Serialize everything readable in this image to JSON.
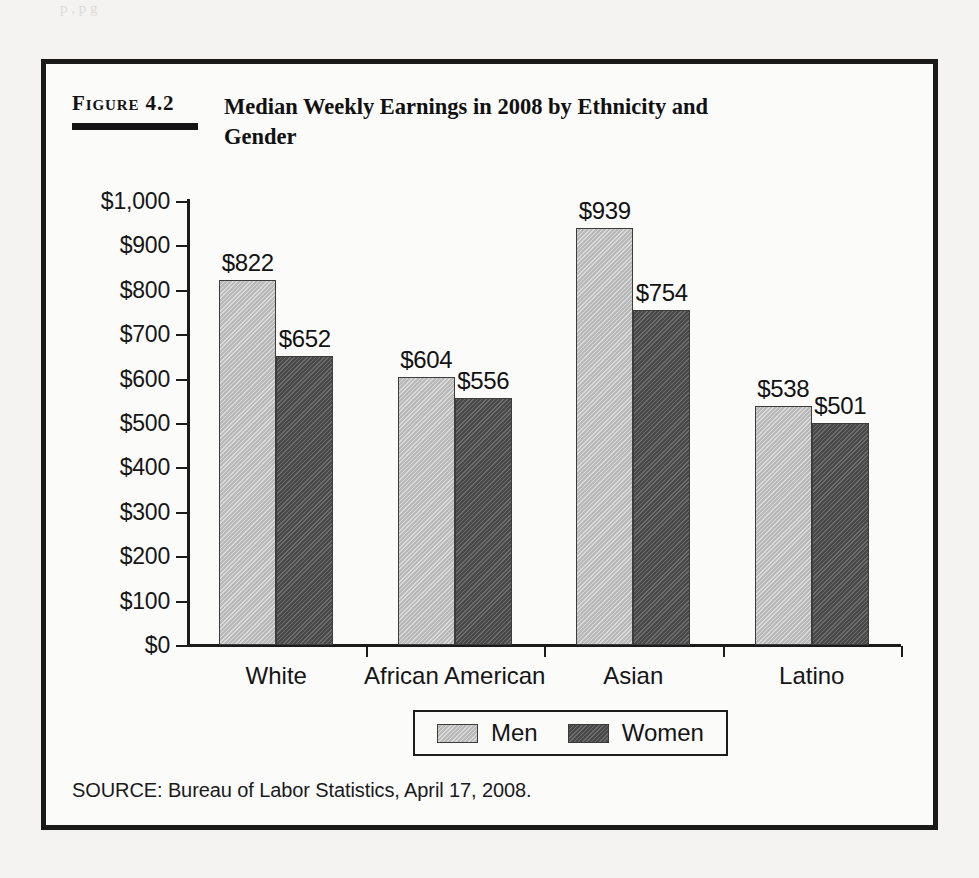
{
  "page": {
    "bleed_text": "p                    ,         p  g"
  },
  "figure": {
    "number_label": "Figure 4.2",
    "title": "Median Weekly Earnings in 2008 by Ethnicity and Gender",
    "source": "SOURCE: Bureau of Labor Statistics, April 17, 2008."
  },
  "colors": {
    "men_bar": "#c2c2c2",
    "women_bar": "#595959",
    "axis": "#1b1b1b",
    "frame": "#1a1a1a",
    "figure_background": "#fbfbfa",
    "page_background": "#f4f3f1"
  },
  "chart_data": {
    "type": "bar",
    "title": "Median Weekly Earnings in 2008 by Ethnicity and Gender",
    "subtitle": "",
    "xlabel": "",
    "ylabel": "",
    "categories": [
      "White",
      "African American",
      "Asian",
      "Latino"
    ],
    "series": [
      {
        "name": "Men",
        "color": "#c2c2c2",
        "values": [
          822,
          604,
          939,
          538
        ],
        "value_labels": [
          "$822",
          "$604",
          "$939",
          "$538"
        ]
      },
      {
        "name": "Women",
        "color": "#595959",
        "values": [
          652,
          556,
          754,
          501
        ],
        "value_labels": [
          "$652",
          "$556",
          "$754",
          "$501"
        ]
      }
    ],
    "ylim": [
      0,
      1000
    ],
    "ytick_values": [
      0,
      100,
      200,
      300,
      400,
      500,
      600,
      700,
      800,
      900,
      1000
    ],
    "ytick_labels": [
      "$0",
      "$100",
      "$200",
      "$300",
      "$400",
      "$500",
      "$600",
      "$700",
      "$800",
      "$900",
      "$1,000"
    ],
    "grid": false,
    "legend_position": "bottom",
    "legend_entries": [
      "Men",
      "Women"
    ],
    "value_labels_shown": true
  }
}
